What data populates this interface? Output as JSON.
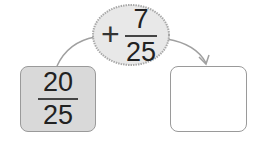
{
  "start": {
    "numerator": "20",
    "denominator": "25",
    "fill": "#d9d9d9"
  },
  "operation": {
    "sign": "+",
    "numerator": "7",
    "denominator": "25",
    "fill": "#e8e8e8"
  },
  "result": {
    "numerator": "",
    "denominator": "",
    "fill": "#ffffff"
  },
  "colors": {
    "stroke": "#9a9a9a",
    "text": "#222222"
  }
}
